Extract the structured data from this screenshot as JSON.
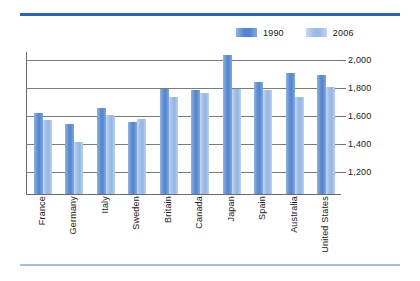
{
  "chart_data": {
    "type": "bar",
    "title": "",
    "subtitle": "",
    "xlabel": "",
    "ylabel": "",
    "categories": [
      "France",
      "Germany",
      "Italy",
      "Sweden",
      "Britain",
      "Canada",
      "Japan",
      "Spain",
      "Australia",
      "United States"
    ],
    "series": [
      {
        "name": "1990",
        "color": "#5286d2",
        "values": [
          1614,
          1536,
          1650,
          1550,
          1790,
          1780,
          2031,
          1840,
          1900,
          1890
        ]
      },
      {
        "name": "2006",
        "color": "#9cbbe8",
        "values": [
          1564,
          1410,
          1600,
          1570,
          1730,
          1760,
          1790,
          1780,
          1730,
          1800
        ]
      }
    ],
    "ylim": [
      1036,
      2060
    ],
    "yticks": [
      1200,
      1400,
      1600,
      1800,
      2000
    ],
    "ytick_labels": [
      "1,200",
      "1,400",
      "1,600",
      "1,800",
      "2,000"
    ],
    "grid": true,
    "legend_position": "top-right",
    "annotations": []
  },
  "legend": {
    "items": [
      {
        "label": "1990",
        "color": "#5286d2"
      },
      {
        "label": "2006",
        "color": "#9cbbe8"
      }
    ]
  },
  "decoration": {
    "rule_top_color": "#2a5fc4",
    "rule_bottom_color": "#9fc0e8"
  }
}
